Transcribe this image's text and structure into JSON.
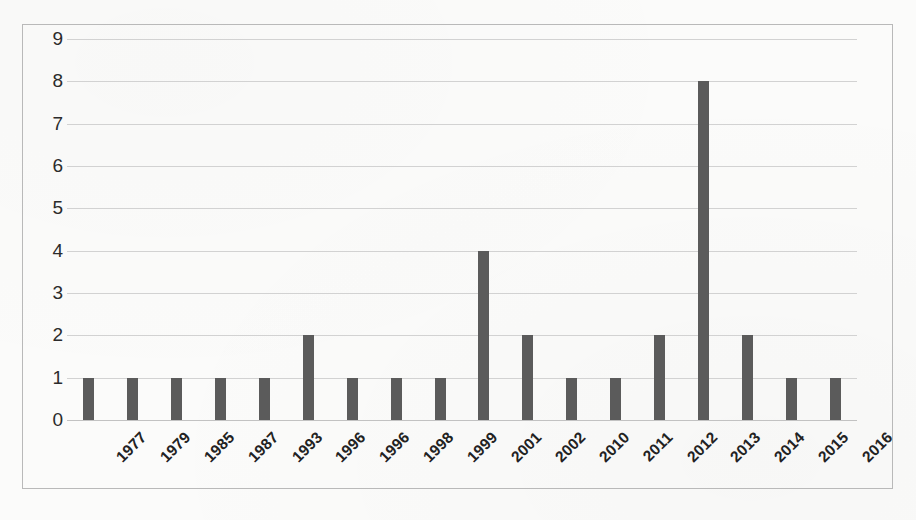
{
  "chart_data": {
    "type": "bar",
    "title": "",
    "subtitle": "",
    "xlabel": "",
    "ylabel": "",
    "categories": [
      "1977",
      "1979",
      "1985",
      "1987",
      "1993",
      "1996",
      "1996",
      "1998",
      "1999",
      "2001",
      "2002",
      "2010",
      "2011",
      "2012",
      "2013",
      "2014",
      "2015",
      "2016"
    ],
    "values": [
      1,
      1,
      1,
      1,
      1,
      2,
      1,
      1,
      1,
      4,
      2,
      1,
      1,
      2,
      8,
      2,
      1,
      1
    ],
    "ylim": [
      0,
      9
    ],
    "y_ticks": [
      "9",
      "8",
      "7",
      "6",
      "5",
      "4",
      "3",
      "2",
      "1",
      "0"
    ],
    "y_tick_values": [
      9,
      8,
      7,
      6,
      5,
      4,
      3,
      2,
      1,
      0
    ],
    "grid": true,
    "legend": false,
    "legend_position": "none",
    "series": [
      {
        "name": "count",
        "values": [
          1,
          1,
          1,
          1,
          1,
          2,
          1,
          1,
          1,
          4,
          2,
          1,
          1,
          2,
          8,
          2,
          1,
          1
        ]
      }
    ],
    "colors": {
      "bar": "#5b5b5b",
      "gridline": "#d2d2d2",
      "frame": "#b9b9b9",
      "tick_label": "#2b2b2b",
      "background": "#fbfbfa"
    }
  }
}
